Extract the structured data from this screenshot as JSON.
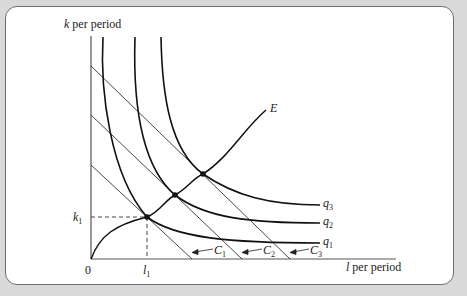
{
  "diagram": {
    "y_axis_label_var": "k",
    "y_axis_label_rest": " per period",
    "x_axis_label_var": "l",
    "x_axis_label_rest": " per period",
    "origin_label": "0",
    "k1_label_var": "k",
    "k1_label_sub": "1",
    "l1_label_var": "l",
    "l1_label_sub": "1",
    "expansion_path_label": "E",
    "isoquants": [
      {
        "var": "q",
        "sub": "1"
      },
      {
        "var": "q",
        "sub": "2"
      },
      {
        "var": "q",
        "sub": "3"
      }
    ],
    "isocost_lines": [
      {
        "var": "C",
        "sub": "1"
      },
      {
        "var": "C",
        "sub": "2"
      },
      {
        "var": "C",
        "sub": "3"
      }
    ],
    "colors": {
      "background": "#d9d9d9",
      "card": "#ffffff",
      "ink": "#222222",
      "border": "#6e6e6e"
    }
  }
}
